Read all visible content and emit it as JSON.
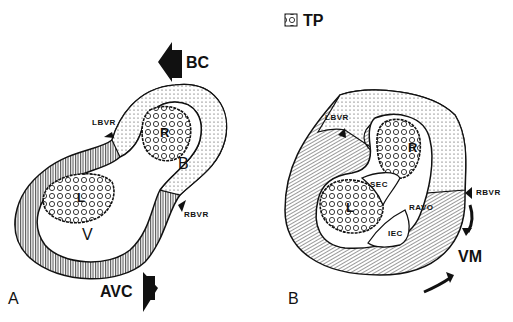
{
  "legend": {
    "icon": "trabecular-pattern-swatch",
    "label": "TP"
  },
  "panel_a": {
    "panel_label": "A",
    "labels": {
      "bc": "BC",
      "avc": "AVC",
      "lbvr": "LBVR",
      "rbvr": "RBVR",
      "b": "B",
      "v": "V",
      "r": "R",
      "l": "L"
    }
  },
  "panel_b": {
    "panel_label": "B",
    "labels": {
      "lbvr": "LBVR",
      "rbvr": "RBVR",
      "vm": "VM",
      "sec": "SEC",
      "iec": "IEC",
      "ravo": "RAVO",
      "r": "R",
      "l": "L"
    }
  },
  "colors": {
    "ink": "#111111",
    "background": "#ffffff"
  }
}
